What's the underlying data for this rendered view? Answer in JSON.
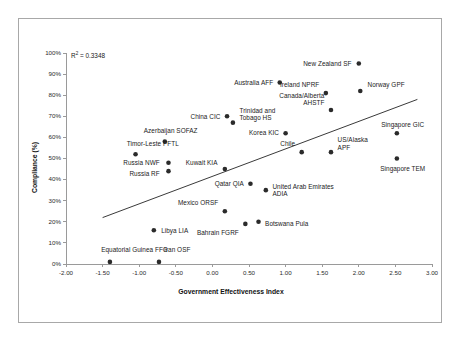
{
  "chart_data": {
    "type": "scatter",
    "title": "",
    "xlabel": "Government Effectiveness Index",
    "ylabel": "Compliance (%)",
    "xlim": [
      -2.0,
      3.0
    ],
    "ylim": [
      0,
      100
    ],
    "xticks": [
      "-2.00",
      "-1.50",
      "-1.00",
      "-0.50",
      "0.00",
      "0.50",
      "1.00",
      "1.50",
      "2.00",
      "2.50",
      "3.00"
    ],
    "xtick_values": [
      -2.0,
      -1.5,
      -1.0,
      -0.5,
      0.0,
      0.5,
      1.0,
      1.5,
      2.0,
      2.5,
      3.0
    ],
    "yticks": [
      "0%",
      "10%",
      "20%",
      "30%",
      "40%",
      "50%",
      "60%",
      "70%",
      "80%",
      "90%",
      "100%"
    ],
    "ytick_values": [
      0,
      10,
      20,
      30,
      40,
      50,
      60,
      70,
      80,
      90,
      100
    ],
    "grid": false,
    "legend": false,
    "annotation": "R2 = 0.3348",
    "r_squared_prefix": "R",
    "r_squared_exponent": "2",
    "r_squared_value": " = 0.3348",
    "trendline": {
      "visible": true,
      "x_start": -1.5,
      "y_start": 22,
      "x_end": 2.8,
      "y_end": 78
    },
    "point_color": "#2b2b2b",
    "axis_color": "#9a9a9a",
    "points": [
      {
        "label": "Equatorial Guinea FFG",
        "x": -1.4,
        "y": 1,
        "lx": -1.52,
        "ly": 7,
        "align": "right"
      },
      {
        "label": "Iran OSF",
        "x": -0.73,
        "y": 1,
        "lx": -0.66,
        "ly": 7,
        "align": "right"
      },
      {
        "label": "Libya LIA",
        "x": -0.8,
        "y": 16,
        "lx": -0.7,
        "ly": 16,
        "align": "right"
      },
      {
        "label": "Timor-Leste PFTL",
        "x": -1.05,
        "y": 52,
        "lx": -1.17,
        "ly": 57,
        "align": "right"
      },
      {
        "label": "Russia NWF",
        "x": -0.6,
        "y": 48,
        "lx": -0.72,
        "ly": 48,
        "align": "left"
      },
      {
        "label": "Russia RF",
        "x": -0.6,
        "y": 44,
        "lx": -0.72,
        "ly": 43,
        "align": "left"
      },
      {
        "label": "Azerbaijan SOFAZ",
        "x": -0.65,
        "y": 58,
        "lx": -0.57,
        "ly": 63,
        "align": "center"
      },
      {
        "label": "China CIC",
        "x": 0.2,
        "y": 70,
        "lx": 0.11,
        "ly": 70,
        "align": "left"
      },
      {
        "label": "Trinidad and\nTobago HS",
        "x": 0.28,
        "y": 67,
        "lx": 0.37,
        "ly": 71,
        "align": "right"
      },
      {
        "label": "Kuwait KIA",
        "x": 0.17,
        "y": 45,
        "lx": 0.07,
        "ly": 48,
        "align": "left"
      },
      {
        "label": "Qatar QIA",
        "x": 0.52,
        "y": 38,
        "lx": 0.43,
        "ly": 38,
        "align": "left"
      },
      {
        "label": "Mexico ORSF",
        "x": 0.17,
        "y": 25,
        "lx": 0.08,
        "ly": 29,
        "align": "left"
      },
      {
        "label": "Bahrain FGRF",
        "x": 0.45,
        "y": 19,
        "lx": 0.36,
        "ly": 15,
        "align": "left"
      },
      {
        "label": "Botswana Pula",
        "x": 0.63,
        "y": 20,
        "lx": 0.72,
        "ly": 19,
        "align": "right"
      },
      {
        "label": "United Arab Emirates\nADIA",
        "x": 0.73,
        "y": 35,
        "lx": 0.82,
        "ly": 35,
        "align": "right"
      },
      {
        "label": "Chile",
        "x": 1.22,
        "y": 53,
        "lx": 1.13,
        "ly": 57,
        "align": "left"
      },
      {
        "label": "Korea KIC",
        "x": 1.0,
        "y": 62,
        "lx": 0.91,
        "ly": 62,
        "align": "left"
      },
      {
        "label": "US/Alaska\nAPF",
        "x": 1.62,
        "y": 53,
        "lx": 1.71,
        "ly": 57,
        "align": "right"
      },
      {
        "label": "Canada/Alberta\nAHSTF",
        "x": 1.62,
        "y": 73,
        "lx": 1.53,
        "ly": 78,
        "align": "left"
      },
      {
        "label": "Ireland NPRF",
        "x": 1.55,
        "y": 81,
        "lx": 1.46,
        "ly": 85,
        "align": "left"
      },
      {
        "label": "Australia AFF",
        "x": 0.92,
        "y": 86,
        "lx": 0.83,
        "ly": 86,
        "align": "left"
      },
      {
        "label": "New Zealand SF",
        "x": 2.0,
        "y": 95,
        "lx": 1.9,
        "ly": 95,
        "align": "left"
      },
      {
        "label": "Norway GPF",
        "x": 2.02,
        "y": 82,
        "lx": 2.12,
        "ly": 85,
        "align": "right"
      },
      {
        "label": "Singapore GIC",
        "x": 2.52,
        "y": 62,
        "lx": 2.6,
        "ly": 66,
        "align": "center"
      },
      {
        "label": "Singapore TEM",
        "x": 2.52,
        "y": 50,
        "lx": 2.6,
        "ly": 45,
        "align": "center"
      }
    ]
  }
}
